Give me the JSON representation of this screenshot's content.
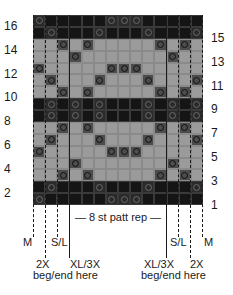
{
  "chart": {
    "columns": 14,
    "rows": 16,
    "colors": {
      "light": "#9b9b9b",
      "dark": "#151515",
      "marked": "#4c4c4c"
    },
    "row_backgrounds": [
      "dark",
      "dark",
      "light",
      "light",
      "light",
      "light",
      "light",
      "dark",
      "dark",
      "light",
      "light",
      "light",
      "light",
      "light",
      "dark",
      "dark"
    ],
    "marked_cells_by_row": {
      "1": [
        1,
        7,
        8,
        9
      ],
      "2": [
        2,
        6,
        10,
        14
      ],
      "3": [
        3,
        5,
        11,
        13
      ],
      "4": [
        4,
        12
      ],
      "5": [
        1,
        7,
        8,
        9
      ],
      "6": [
        2,
        6,
        10,
        14
      ],
      "7": [
        3,
        5,
        11,
        13
      ],
      "8": [
        2,
        4,
        6,
        10,
        12,
        14
      ],
      "9": [
        2,
        4,
        6,
        10,
        12,
        14
      ],
      "10": [
        3,
        5,
        11,
        13
      ],
      "11": [
        2,
        6,
        10,
        14
      ],
      "12": [
        1,
        7,
        8,
        9
      ],
      "13": [
        4,
        12
      ],
      "14": [
        3,
        5,
        11,
        13
      ],
      "15": [
        2,
        6,
        10,
        14
      ],
      "16": [
        1,
        7,
        8,
        9
      ]
    }
  },
  "row_numbers": {
    "left": [
      "16",
      "14",
      "12",
      "10",
      "8",
      "6",
      "4",
      "2"
    ],
    "right": [
      "15",
      "13",
      "11",
      "9",
      "7",
      "5",
      "3",
      "1"
    ]
  },
  "labels": {
    "repeat": "— 8 st patt rep —",
    "left": {
      "m": "M",
      "sl": "S/L",
      "x2": "2X",
      "xl3x": "XL/3X",
      "beg_end": "beg/end here"
    },
    "right": {
      "m": "M",
      "sl": "S/L",
      "x2": "2X",
      "xl3x": "XL/3X",
      "beg_end": "beg/end here"
    }
  }
}
